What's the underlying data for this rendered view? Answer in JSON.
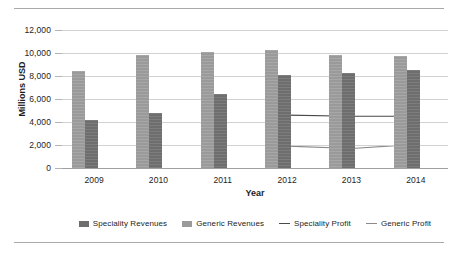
{
  "chart_data": {
    "type": "bar",
    "title": "",
    "xlabel": "Year",
    "ylabel": "Millions USD",
    "categories": [
      "2009",
      "2010",
      "2011",
      "2012",
      "2013",
      "2014"
    ],
    "ylim": [
      0,
      12000
    ],
    "ytick_values": [
      0,
      2000,
      4000,
      6000,
      8000,
      10000,
      12000
    ],
    "ytick_labels": [
      "0",
      "2,000",
      "4,000",
      "6,000",
      "8,000",
      "10,000",
      "12,000"
    ],
    "grid": true,
    "legend_position": "bottom",
    "series": [
      {
        "name": "Generic Revenues",
        "render": "bar",
        "color": "#9a9a9a",
        "values": [
          8400,
          9850,
          10100,
          10300,
          9800,
          9750
        ]
      },
      {
        "name": "Speciality Revenues",
        "render": "bar",
        "color": "#6e6e6e",
        "values": [
          4150,
          4750,
          6400,
          8100,
          8300,
          8500
        ]
      },
      {
        "name": "Speciality Profit",
        "render": "line",
        "color": "#4a4a4a",
        "values": [
          null,
          null,
          null,
          4600,
          4500,
          4500
        ]
      },
      {
        "name": "Generic Profit",
        "render": "line",
        "color": "#8a8a8a",
        "values": [
          null,
          null,
          null,
          1900,
          1700,
          2050
        ]
      }
    ]
  },
  "legend": {
    "items": [
      {
        "label": "Speciality Revenues",
        "marker": "box-dark",
        "color": "#6e6e6e"
      },
      {
        "label": "Generic Revenues",
        "marker": "box-light",
        "color": "#9a9a9a"
      },
      {
        "label": "Speciality Profit",
        "marker": "line-dark",
        "color": "#4a4a4a"
      },
      {
        "label": "Generic Profit",
        "marker": "line-light",
        "color": "#8a8a8a"
      }
    ]
  }
}
